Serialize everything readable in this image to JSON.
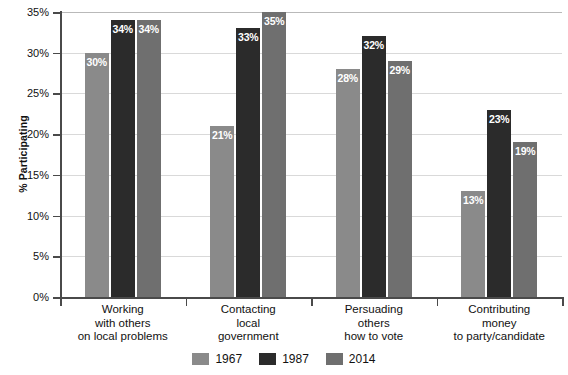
{
  "chart_data": {
    "type": "bar",
    "title": "",
    "xlabel": "",
    "ylabel": "% Participating",
    "ylim": [
      0,
      35
    ],
    "ytick_step": 5,
    "ytick_labels": [
      "0%",
      "5%",
      "10%",
      "15%",
      "20%",
      "25%",
      "30%",
      "35%"
    ],
    "ytick_values": [
      0,
      5,
      10,
      15,
      20,
      25,
      30,
      35
    ],
    "grid": true,
    "legend_position": "bottom",
    "categories": [
      "Working\nwith others\non local problems",
      "Contacting\nlocal\ngovernment",
      "Persuading\nothers\nhow to vote",
      "Contributing\nmoney\nto party/candidate"
    ],
    "category_lines": [
      [
        "Working",
        "with others",
        "on local problems"
      ],
      [
        "Contacting",
        "local",
        "government"
      ],
      [
        "Persuading",
        "others",
        "how to vote"
      ],
      [
        "Contributing",
        "money",
        "to party/candidate"
      ]
    ],
    "series": [
      {
        "name": "1967",
        "color": "#8a8a8a",
        "values": [
          30,
          21,
          28,
          13
        ],
        "labels": [
          "30%",
          "21%",
          "28%",
          "13%"
        ]
      },
      {
        "name": "1987",
        "color": "#2b2b2b",
        "values": [
          34,
          33,
          32,
          23
        ],
        "labels": [
          "34%",
          "33%",
          "32%",
          "23%"
        ]
      },
      {
        "name": "2014",
        "color": "#6f6f6f",
        "values": [
          34,
          35,
          29,
          19
        ],
        "labels": [
          "34%",
          "35%",
          "29%",
          "19%"
        ]
      }
    ]
  },
  "axis": {
    "y_title": "% Participating"
  },
  "legend": {
    "items": [
      {
        "label": "1967",
        "color": "#8a8a8a"
      },
      {
        "label": "1987",
        "color": "#2b2b2b"
      },
      {
        "label": "2014",
        "color": "#6f6f6f"
      }
    ]
  },
  "colors": {
    "axis": "#4a4a4a",
    "grid": "#d9d9d9",
    "text": "#111111",
    "value_label": "#ffffff",
    "background": "#ffffff"
  }
}
